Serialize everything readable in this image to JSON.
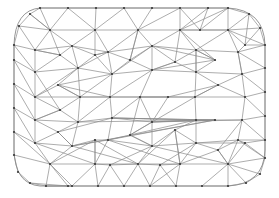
{
  "figure": {
    "name": "triangular-finite-element-mesh",
    "title": "",
    "background_color": "#ffffff",
    "edge_color": "#8a8a8a",
    "node_color": "#3a3a3a",
    "edge_width": 0.7,
    "node_radius": 1.1,
    "width": 279,
    "height": 198
  },
  "chart_data": {
    "type": "mesh",
    "title": "",
    "xlabel": "",
    "ylabel": "",
    "xlim": [
      0,
      279
    ],
    "ylim": [
      0,
      198
    ],
    "grid": false,
    "legend": null,
    "counts": {
      "nodes": 96,
      "edges": 245,
      "boundary_nodes": 36
    },
    "boundary_path": "M 40 8 L 228 8 Q 264 10 265 45 L 265 150 Q 264 184 228 186 L 40 186 Q 15 184 14 150 L 14 45 Q 15 10 40 8 Z",
    "nodes": [
      [
        40,
        8
      ],
      [
        68,
        8
      ],
      [
        96,
        8
      ],
      [
        124,
        8
      ],
      [
        152,
        8
      ],
      [
        180,
        8
      ],
      [
        208,
        8
      ],
      [
        228,
        8
      ],
      [
        249,
        14
      ],
      [
        260,
        28
      ],
      [
        265,
        45
      ],
      [
        265,
        68
      ],
      [
        265,
        92
      ],
      [
        265,
        116
      ],
      [
        265,
        140
      ],
      [
        265,
        158
      ],
      [
        260,
        174
      ],
      [
        246,
        183
      ],
      [
        228,
        186
      ],
      [
        202,
        186
      ],
      [
        176,
        186
      ],
      [
        150,
        186
      ],
      [
        124,
        186
      ],
      [
        98,
        186
      ],
      [
        72,
        186
      ],
      [
        46,
        186
      ],
      [
        30,
        183
      ],
      [
        18,
        172
      ],
      [
        14,
        155
      ],
      [
        14,
        132
      ],
      [
        14,
        108
      ],
      [
        14,
        84
      ],
      [
        14,
        60
      ],
      [
        14,
        45
      ],
      [
        19,
        26
      ],
      [
        30,
        14
      ],
      [
        50,
        30
      ],
      [
        95,
        30
      ],
      [
        138,
        30
      ],
      [
        180,
        30
      ],
      [
        228,
        30
      ],
      [
        35,
        50
      ],
      [
        72,
        46
      ],
      [
        108,
        52
      ],
      [
        152,
        46
      ],
      [
        196,
        50
      ],
      [
        238,
        52
      ],
      [
        35,
        72
      ],
      [
        78,
        68
      ],
      [
        112,
        74
      ],
      [
        152,
        70
      ],
      [
        196,
        72
      ],
      [
        242,
        74
      ],
      [
        35,
        97
      ],
      [
        80,
        97
      ],
      [
        110,
        97
      ],
      [
        140,
        97
      ],
      [
        168,
        97
      ],
      [
        195,
        97
      ],
      [
        245,
        97
      ],
      [
        35,
        120
      ],
      [
        78,
        122
      ],
      [
        112,
        118
      ],
      [
        152,
        122
      ],
      [
        196,
        120
      ],
      [
        242,
        120
      ],
      [
        35,
        143
      ],
      [
        72,
        146
      ],
      [
        108,
        140
      ],
      [
        152,
        146
      ],
      [
        196,
        143
      ],
      [
        238,
        140
      ],
      [
        50,
        164
      ],
      [
        95,
        164
      ],
      [
        138,
        164
      ],
      [
        180,
        164
      ],
      [
        228,
        164
      ],
      [
        60,
        55
      ],
      [
        60,
        110
      ],
      [
        130,
        60
      ],
      [
        130,
        135
      ],
      [
        215,
        60
      ],
      [
        215,
        120
      ],
      [
        95,
        140
      ],
      [
        175,
        130
      ],
      [
        95,
        55
      ],
      [
        175,
        62
      ],
      [
        58,
        85
      ],
      [
        58,
        132
      ],
      [
        218,
        85
      ],
      [
        218,
        150
      ],
      [
        110,
        165
      ],
      [
        160,
        165
      ],
      [
        68,
        186
      ],
      [
        200,
        30
      ],
      [
        245,
        45
      ],
      [
        245,
        143
      ]
    ],
    "edges": [
      [
        0,
        1
      ],
      [
        1,
        2
      ],
      [
        2,
        3
      ],
      [
        3,
        4
      ],
      [
        4,
        5
      ],
      [
        5,
        6
      ],
      [
        6,
        7
      ],
      [
        7,
        8
      ],
      [
        8,
        9
      ],
      [
        9,
        10
      ],
      [
        10,
        11
      ],
      [
        11,
        12
      ],
      [
        12,
        13
      ],
      [
        13,
        14
      ],
      [
        14,
        15
      ],
      [
        15,
        16
      ],
      [
        16,
        17
      ],
      [
        17,
        18
      ],
      [
        18,
        19
      ],
      [
        19,
        20
      ],
      [
        20,
        21
      ],
      [
        21,
        22
      ],
      [
        22,
        23
      ],
      [
        23,
        24
      ],
      [
        24,
        25
      ],
      [
        25,
        26
      ],
      [
        26,
        27
      ],
      [
        27,
        28
      ],
      [
        28,
        29
      ],
      [
        29,
        30
      ],
      [
        30,
        31
      ],
      [
        31,
        32
      ],
      [
        32,
        33
      ],
      [
        33,
        34
      ],
      [
        34,
        35
      ],
      [
        35,
        0
      ],
      [
        0,
        36
      ],
      [
        1,
        36
      ],
      [
        1,
        37
      ],
      [
        2,
        37
      ],
      [
        3,
        37
      ],
      [
        3,
        38
      ],
      [
        4,
        38
      ],
      [
        5,
        38
      ],
      [
        5,
        39
      ],
      [
        6,
        39
      ],
      [
        7,
        39
      ],
      [
        7,
        40
      ],
      [
        8,
        40
      ],
      [
        9,
        40
      ],
      [
        10,
        40
      ],
      [
        36,
        37
      ],
      [
        37,
        38
      ],
      [
        38,
        39
      ],
      [
        39,
        40
      ],
      [
        35,
        36
      ],
      [
        34,
        36
      ],
      [
        33,
        41
      ],
      [
        34,
        41
      ],
      [
        36,
        41
      ],
      [
        36,
        42
      ],
      [
        41,
        42
      ],
      [
        42,
        37
      ],
      [
        37,
        43
      ],
      [
        42,
        43
      ],
      [
        43,
        38
      ],
      [
        38,
        44
      ],
      [
        43,
        44
      ],
      [
        44,
        39
      ],
      [
        39,
        45
      ],
      [
        44,
        45
      ],
      [
        45,
        40
      ],
      [
        40,
        46
      ],
      [
        45,
        46
      ],
      [
        46,
        10
      ],
      [
        46,
        11
      ],
      [
        41,
        47
      ],
      [
        33,
        47
      ],
      [
        32,
        47
      ],
      [
        42,
        48
      ],
      [
        47,
        48
      ],
      [
        43,
        49
      ],
      [
        48,
        49
      ],
      [
        44,
        50
      ],
      [
        49,
        50
      ],
      [
        45,
        51
      ],
      [
        50,
        51
      ],
      [
        46,
        52
      ],
      [
        51,
        52
      ],
      [
        52,
        11
      ],
      [
        52,
        12
      ],
      [
        47,
        53
      ],
      [
        32,
        53
      ],
      [
        31,
        53
      ],
      [
        48,
        54
      ],
      [
        53,
        54
      ],
      [
        49,
        55
      ],
      [
        54,
        55
      ],
      [
        50,
        56
      ],
      [
        55,
        56
      ],
      [
        51,
        58
      ],
      [
        56,
        57
      ],
      [
        57,
        58
      ],
      [
        52,
        59
      ],
      [
        58,
        59
      ],
      [
        59,
        12
      ],
      [
        59,
        13
      ],
      [
        53,
        60
      ],
      [
        31,
        60
      ],
      [
        30,
        60
      ],
      [
        54,
        61
      ],
      [
        60,
        61
      ],
      [
        55,
        62
      ],
      [
        61,
        62
      ],
      [
        56,
        63
      ],
      [
        62,
        63
      ],
      [
        58,
        64
      ],
      [
        63,
        64
      ],
      [
        59,
        65
      ],
      [
        64,
        65
      ],
      [
        65,
        13
      ],
      [
        65,
        14
      ],
      [
        60,
        66
      ],
      [
        30,
        66
      ],
      [
        29,
        66
      ],
      [
        61,
        67
      ],
      [
        66,
        67
      ],
      [
        62,
        68
      ],
      [
        67,
        68
      ],
      [
        63,
        69
      ],
      [
        68,
        69
      ],
      [
        64,
        70
      ],
      [
        69,
        70
      ],
      [
        65,
        71
      ],
      [
        70,
        71
      ],
      [
        71,
        14
      ],
      [
        71,
        15
      ],
      [
        66,
        72
      ],
      [
        29,
        72
      ],
      [
        28,
        72
      ],
      [
        67,
        72
      ],
      [
        68,
        73
      ],
      [
        72,
        73
      ],
      [
        69,
        74
      ],
      [
        73,
        74
      ],
      [
        70,
        75
      ],
      [
        74,
        75
      ],
      [
        71,
        76
      ],
      [
        75,
        76
      ],
      [
        76,
        15
      ],
      [
        76,
        16
      ],
      [
        72,
        25
      ],
      [
        72,
        24
      ],
      [
        73,
        23
      ],
      [
        73,
        24
      ],
      [
        74,
        22
      ],
      [
        74,
        21
      ],
      [
        75,
        20
      ],
      [
        75,
        21
      ],
      [
        76,
        19
      ],
      [
        76,
        18
      ],
      [
        76,
        17
      ],
      [
        36,
        77
      ],
      [
        41,
        77
      ],
      [
        42,
        77
      ],
      [
        47,
        77
      ],
      [
        48,
        77
      ],
      [
        53,
        78
      ],
      [
        54,
        78
      ],
      [
        60,
        78
      ],
      [
        61,
        78
      ],
      [
        47,
        78
      ],
      [
        38,
        79
      ],
      [
        43,
        79
      ],
      [
        44,
        79
      ],
      [
        49,
        79
      ],
      [
        50,
        79
      ],
      [
        63,
        80
      ],
      [
        64,
        80
      ],
      [
        68,
        80
      ],
      [
        69,
        80
      ],
      [
        56,
        80
      ],
      [
        58,
        80
      ],
      [
        39,
        81
      ],
      [
        45,
        81
      ],
      [
        44,
        81
      ],
      [
        51,
        81
      ],
      [
        50,
        81
      ],
      [
        62,
        82
      ],
      [
        63,
        82
      ],
      [
        67,
        82
      ],
      [
        68,
        82
      ],
      [
        61,
        82
      ],
      [
        67,
        83
      ],
      [
        68,
        83
      ],
      [
        73,
        83
      ],
      [
        72,
        83
      ],
      [
        74,
        83
      ],
      [
        69,
        84
      ],
      [
        70,
        84
      ],
      [
        74,
        84
      ],
      [
        75,
        84
      ],
      [
        64,
        84
      ],
      [
        37,
        85
      ],
      [
        42,
        85
      ],
      [
        43,
        85
      ],
      [
        48,
        85
      ],
      [
        49,
        85
      ],
      [
        44,
        86
      ],
      [
        45,
        86
      ],
      [
        50,
        86
      ],
      [
        51,
        86
      ],
      [
        39,
        86
      ],
      [
        48,
        87
      ],
      [
        49,
        87
      ],
      [
        54,
        87
      ],
      [
        55,
        87
      ],
      [
        53,
        87
      ],
      [
        61,
        88
      ],
      [
        62,
        88
      ],
      [
        67,
        88
      ],
      [
        66,
        88
      ],
      [
        60,
        88
      ],
      [
        51,
        89
      ],
      [
        52,
        89
      ],
      [
        57,
        89
      ],
      [
        58,
        89
      ],
      [
        59,
        89
      ],
      [
        70,
        90
      ],
      [
        71,
        90
      ],
      [
        75,
        90
      ],
      [
        76,
        90
      ],
      [
        65,
        90
      ],
      [
        73,
        91
      ],
      [
        74,
        91
      ],
      [
        22,
        91
      ],
      [
        23,
        91
      ],
      [
        69,
        91
      ],
      [
        74,
        92
      ],
      [
        75,
        92
      ],
      [
        20,
        92
      ],
      [
        21,
        92
      ],
      [
        70,
        92
      ],
      [
        24,
        93
      ],
      [
        25,
        93
      ],
      [
        72,
        93
      ],
      [
        26,
        93
      ],
      [
        6,
        94
      ],
      [
        7,
        94
      ],
      [
        39,
        94
      ],
      [
        40,
        94
      ],
      [
        5,
        94
      ],
      [
        9,
        95
      ],
      [
        10,
        95
      ],
      [
        40,
        95
      ],
      [
        46,
        95
      ],
      [
        8,
        95
      ],
      [
        14,
        96
      ],
      [
        15,
        96
      ],
      [
        70,
        96
      ],
      [
        71,
        96
      ],
      [
        76,
        96
      ],
      [
        54,
        55
      ],
      [
        55,
        57
      ],
      [
        56,
        58
      ],
      [
        62,
        64
      ],
      [
        63,
        65
      ],
      [
        49,
        54
      ],
      [
        55,
        61
      ],
      [
        50,
        55
      ],
      [
        56,
        62
      ],
      [
        57,
        63
      ],
      [
        43,
        48
      ],
      [
        48,
        53
      ],
      [
        44,
        49
      ],
      [
        45,
        51
      ],
      [
        46,
        52
      ],
      [
        66,
        73
      ],
      [
        67,
        74
      ],
      [
        68,
        75
      ],
      [
        69,
        76
      ],
      [
        36,
        35
      ],
      [
        77,
        41
      ],
      [
        78,
        60
      ],
      [
        79,
        38
      ],
      [
        80,
        69
      ],
      [
        81,
        45
      ],
      [
        82,
        62
      ],
      [
        83,
        73
      ],
      [
        84,
        75
      ],
      [
        85,
        43
      ],
      [
        86,
        50
      ],
      [
        87,
        54
      ],
      [
        88,
        67
      ],
      [
        89,
        58
      ],
      [
        90,
        76
      ]
    ]
  }
}
